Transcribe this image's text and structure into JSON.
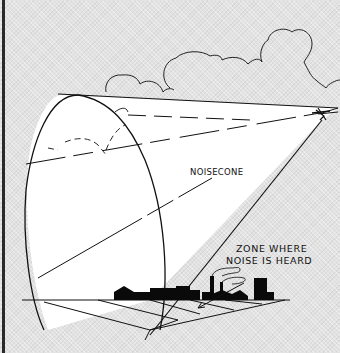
{
  "diagram": {
    "labels": {
      "cone": "NOISECONE",
      "zone_line1": "ZONE WHERE",
      "zone_line2": "NOISE IS HEARD"
    },
    "elements": [
      "clouds",
      "aircraft",
      "noise-cone",
      "ground-plane",
      "factory-skyline",
      "zone-arrow"
    ],
    "colors": {
      "ink": "#111111",
      "cone_fill": "#ffffff",
      "background": "#e2e2e2"
    }
  }
}
